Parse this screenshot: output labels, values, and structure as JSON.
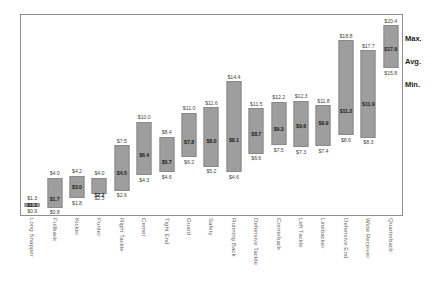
{
  "chart_data": {
    "type": "bar",
    "subtype": "floating-range-bar",
    "title": "",
    "xlabel": "",
    "ylabel": "",
    "ylim": [
      0,
      21.5
    ],
    "grid": false,
    "value_prefix": "$",
    "legend_position": "right",
    "legend": [
      "Max.",
      "Avg.",
      "Min."
    ],
    "categories": [
      "Long Snapper",
      "Fullback",
      "Kicker",
      "Punter",
      "Right Tackle",
      "Center",
      "Tight End",
      "Guard",
      "Safety",
      "Running Back",
      "Defensive Tackle",
      "Cornerback",
      "Left Tackle",
      "Linebacker",
      "Defensive End",
      "Wide Receiver",
      "Quarterback"
    ],
    "series": [
      {
        "name": "Max.",
        "values": [
          1.3,
          4.0,
          4.2,
          4.0,
          7.5,
          10.0,
          8.4,
          11.0,
          11.6,
          14.4,
          11.5,
          12.2,
          12.3,
          11.8,
          18.8,
          17.7,
          20.4
        ]
      },
      {
        "name": "Avg.",
        "values": [
          1.1,
          1.7,
          3.0,
          2.2,
          4.5,
          6.4,
          5.7,
          7.8,
          8.0,
          8.1,
          8.7,
          9.3,
          9.6,
          9.9,
          11.2,
          11.9,
          17.9
        ]
      },
      {
        "name": "Min.",
        "values": [
          0.9,
          0.8,
          1.8,
          2.3,
          2.6,
          4.3,
          4.6,
          6.2,
          5.2,
          4.6,
          6.6,
          7.5,
          7.3,
          7.4,
          8.6,
          8.3,
          15.8
        ]
      }
    ],
    "max_labels": [
      "$1.3",
      "$4.0",
      "$4.2",
      "$4.0",
      "$7.5",
      "$10.0",
      "$8.4",
      "$11.0",
      "$11.6",
      "$14.4",
      "$11.5",
      "$12.2",
      "$12.3",
      "$11.8",
      "$18.8",
      "$17.7",
      "$20.4"
    ],
    "avg_labels": [
      "$1.1",
      "$1.7",
      "$3.0",
      "$2.2",
      "$4.5",
      "$6.4",
      "$5.7",
      "$7.8",
      "$8.0",
      "$8.1",
      "$8.7",
      "$9.3",
      "$9.6",
      "$9.9",
      "$11.2",
      "$11.9",
      "$17.9"
    ],
    "min_labels": [
      "$0.9",
      "$0.8",
      "$1.8",
      "$2.3",
      "$2.6",
      "$4.3",
      "$4.6",
      "$6.2",
      "$5.2",
      "$4.6",
      "$6.6",
      "$7.5",
      "$7.3",
      "$7.4",
      "$8.6",
      "$8.3",
      "$15.8"
    ],
    "colors": {
      "bar": "#9e9e9e",
      "bar_border": "#8a8a8a",
      "frame": "#8f8f8f",
      "label": "#4a4a4a",
      "avg_label": "#1d1d1d",
      "category_label": "#6b6b6b",
      "background": "#ffffff"
    }
  }
}
